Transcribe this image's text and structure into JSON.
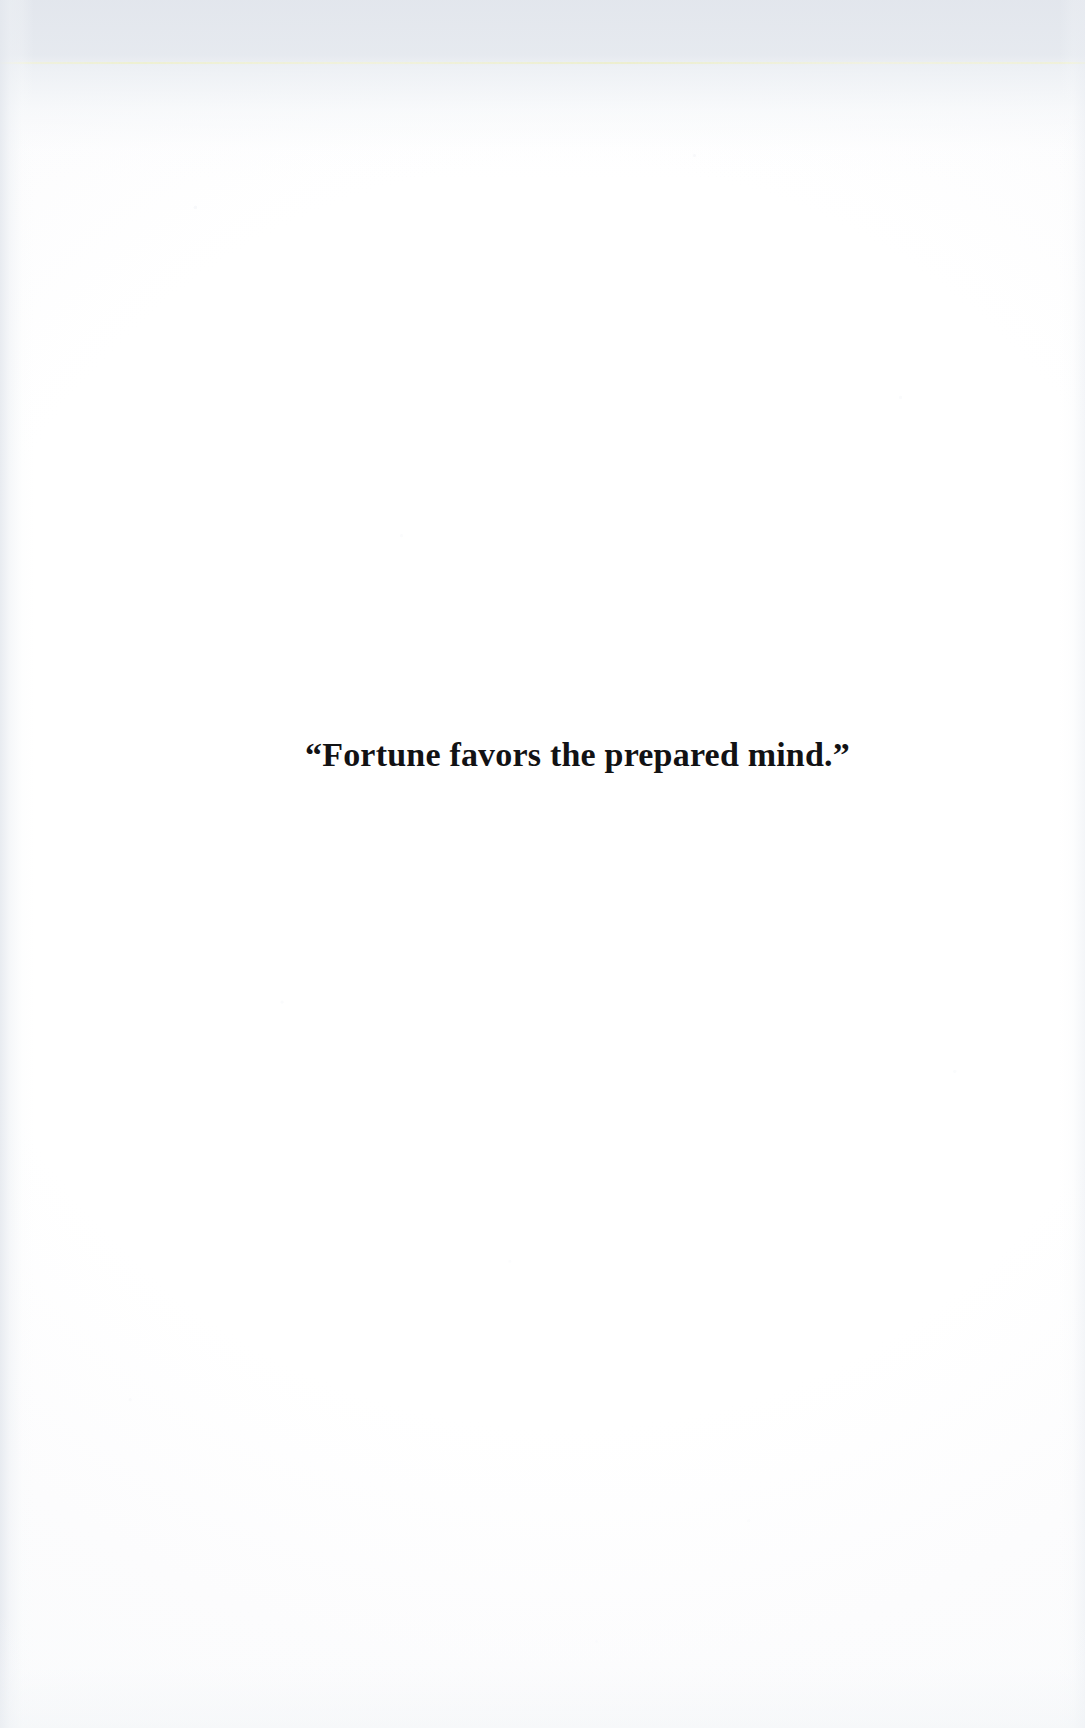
{
  "page": {
    "kind": "scanned-book-page",
    "orientation": "portrait",
    "background_color": "#fdfdfd",
    "width_px": 1085,
    "height_px": 1728
  },
  "artifacts": {
    "top_tint_color": "#e1e5ec",
    "scan_line_color": "#eef0cd",
    "gutter_shadow_color": "#e4e8ee",
    "speckle_color": "#e8ecf2"
  },
  "content": {
    "epigraph": {
      "text": "“Fortune favors the prepared mind.”",
      "plain_text": "Fortune favors the prepared mind.",
      "opening_quote": "“",
      "closing_quote": "”",
      "style": "bold-serif",
      "alignment": "center",
      "text_color": "#121214",
      "font_size_px": 34
    }
  }
}
